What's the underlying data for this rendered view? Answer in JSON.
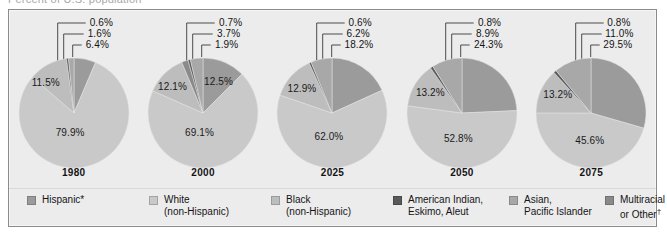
{
  "top_cut_text": "Percent of U.S. population",
  "chart_data": {
    "type": "pie",
    "categories": [
      "Hispanic*",
      "White (non-Hispanic)",
      "Black (non-Hispanic)",
      "American Indian, Eskimo, Aleut",
      "Asian, Pacific Islander",
      "Multiracial or Other"
    ],
    "series": [
      {
        "name": "1980",
        "values": [
          6.4,
          79.9,
          11.5,
          0.6,
          1.6,
          0.0
        ]
      },
      {
        "name": "2000",
        "values": [
          12.5,
          69.1,
          12.1,
          0.7,
          3.7,
          1.9
        ]
      },
      {
        "name": "2025",
        "values": [
          18.2,
          62.0,
          12.9,
          0.6,
          6.2,
          0.0
        ]
      },
      {
        "name": "2050",
        "values": [
          24.3,
          52.8,
          13.2,
          0.8,
          8.9,
          0.0
        ]
      },
      {
        "name": "2075",
        "values": [
          29.5,
          45.6,
          13.2,
          0.8,
          11.0,
          0.0
        ]
      }
    ],
    "legend_position": "bottom",
    "grid": false
  },
  "colors": {
    "hispanic": "#9b9b9b",
    "white": "#c9c9c9",
    "black": "#bdbdbd",
    "american_indian": "#5a5a5a",
    "asian": "#a8a8a8",
    "multiracial": "#8a8a8a",
    "panel_bg": "#ececed",
    "panel_border": "#8b8b8b",
    "text": "#141414"
  },
  "panels": [
    {
      "year": "1980",
      "callouts": [
        "0.6%",
        "1.6%",
        "6.4%"
      ],
      "inside": [
        {
          "text": "11.5%",
          "left": 14,
          "top": 20
        },
        {
          "text": "79.9%",
          "left": 38,
          "top": 70
        }
      ],
      "slices": [
        {
          "name": "hispanic",
          "value": 6.4,
          "color": "#9b9b9b"
        },
        {
          "name": "white",
          "value": 79.9,
          "color": "#c9c9c9"
        },
        {
          "name": "black",
          "value": 11.5,
          "color": "#bdbdbd"
        },
        {
          "name": "american_indian",
          "value": 0.6,
          "color": "#5a5a5a"
        },
        {
          "name": "asian",
          "value": 1.6,
          "color": "#a8a8a8"
        }
      ]
    },
    {
      "year": "2000",
      "callouts": [
        "0.7%",
        "3.7%",
        "1.9%"
      ],
      "inside": [
        {
          "text": "12.1%",
          "left": 11,
          "top": 24
        },
        {
          "text": "12.5%",
          "left": 57,
          "top": 19
        },
        {
          "text": "69.1%",
          "left": 38,
          "top": 70
        }
      ],
      "slices": [
        {
          "name": "hispanic",
          "value": 12.5,
          "color": "#9b9b9b"
        },
        {
          "name": "white",
          "value": 69.1,
          "color": "#c9c9c9"
        },
        {
          "name": "black",
          "value": 12.1,
          "color": "#bdbdbd"
        },
        {
          "name": "american_indian",
          "value": 0.7,
          "color": "#5a5a5a"
        },
        {
          "name": "asian",
          "value": 3.7,
          "color": "#a8a8a8"
        },
        {
          "name": "multiracial",
          "value": 1.9,
          "color": "#8a8a8a"
        }
      ]
    },
    {
      "year": "2025",
      "callouts": [
        "0.6%",
        "6.2%",
        "18.2%"
      ],
      "inside": [
        {
          "text": "12.9%",
          "left": 11,
          "top": 26
        },
        {
          "text": "62.0%",
          "left": 38,
          "top": 74
        }
      ],
      "slices": [
        {
          "name": "hispanic",
          "value": 18.2,
          "color": "#9b9b9b"
        },
        {
          "name": "white",
          "value": 62.0,
          "color": "#c9c9c9"
        },
        {
          "name": "black",
          "value": 12.9,
          "color": "#bdbdbd"
        },
        {
          "name": "american_indian",
          "value": 0.6,
          "color": "#5a5a5a"
        },
        {
          "name": "asian",
          "value": 6.2,
          "color": "#a8a8a8"
        }
      ]
    },
    {
      "year": "2050",
      "callouts": [
        "0.8%",
        "8.9%",
        "24.3%"
      ],
      "inside": [
        {
          "text": "13.2%",
          "left": 10,
          "top": 30
        },
        {
          "text": "52.8%",
          "left": 38,
          "top": 76
        }
      ],
      "slices": [
        {
          "name": "hispanic",
          "value": 24.3,
          "color": "#9b9b9b"
        },
        {
          "name": "white",
          "value": 52.8,
          "color": "#c9c9c9"
        },
        {
          "name": "black",
          "value": 13.2,
          "color": "#bdbdbd"
        },
        {
          "name": "american_indian",
          "value": 0.8,
          "color": "#5a5a5a"
        },
        {
          "name": "asian",
          "value": 8.9,
          "color": "#a8a8a8"
        }
      ]
    },
    {
      "year": "2075",
      "callouts": [
        "0.8%",
        "11.0%",
        "29.5%"
      ],
      "inside": [
        {
          "text": "13.2%",
          "left": 8,
          "top": 32
        },
        {
          "text": "45.6%",
          "left": 40,
          "top": 78
        }
      ],
      "slices": [
        {
          "name": "hispanic",
          "value": 29.5,
          "color": "#9b9b9b"
        },
        {
          "name": "white",
          "value": 45.6,
          "color": "#c9c9c9"
        },
        {
          "name": "black",
          "value": 13.2,
          "color": "#bdbdbd"
        },
        {
          "name": "american_indian",
          "value": 0.8,
          "color": "#5a5a5a"
        },
        {
          "name": "asian",
          "value": 11.0,
          "color": "#a8a8a8"
        }
      ]
    }
  ],
  "legend": [
    {
      "label_line1": "Hispanic*",
      "label_line2": "",
      "color": "#9b9b9b",
      "left": 18
    },
    {
      "label_line1": "White",
      "label_line2": "(non-Hispanic)",
      "color": "#c9c9c9",
      "left": 140
    },
    {
      "label_line1": "Black",
      "label_line2": "(non-Hispanic)",
      "color": "#bdbdbd",
      "left": 262
    },
    {
      "label_line1": "American Indian,",
      "label_line2": "Eskimo, Aleut",
      "color": "#5a5a5a",
      "left": 384
    },
    {
      "label_line1": "Asian,",
      "label_line2": "Pacific Islander",
      "color": "#a8a8a8",
      "left": 500
    },
    {
      "label_line1": "Multiracial",
      "label_line2": "or Other",
      "color": "#8a8a8a",
      "left": 596,
      "dagger": true
    }
  ]
}
